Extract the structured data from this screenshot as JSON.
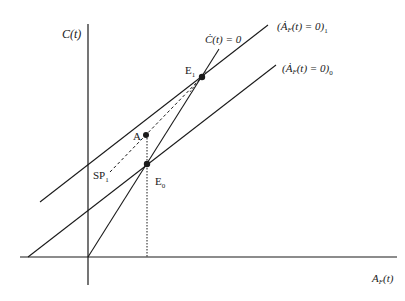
{
  "diagram": {
    "type": "phase-diagram",
    "axes": {
      "y_label": "C(t)",
      "x_label": "A",
      "x_label_sub": "F",
      "x_label_suffix": "(t)"
    },
    "curves": {
      "c_dot_zero": {
        "label": "Ċ(t) = 0"
      },
      "a_dot_zero_1": {
        "label_main": "(Ȧ",
        "label_sub_f": "F",
        "label_rest": "(t) = 0)",
        "label_sub": "1"
      },
      "a_dot_zero_0": {
        "label_main": "(Ȧ",
        "label_sub_f": "F",
        "label_rest": "(t) = 0)",
        "label_sub": "0"
      }
    },
    "points": {
      "e1": {
        "label": "E",
        "sub": "1"
      },
      "e0": {
        "label": "E",
        "sub": "0"
      },
      "a": {
        "label": "A"
      },
      "sp1": {
        "label": "SP",
        "sub": "1"
      }
    },
    "colors": {
      "line": "#1a1a1a",
      "background": "#ffffff"
    }
  }
}
